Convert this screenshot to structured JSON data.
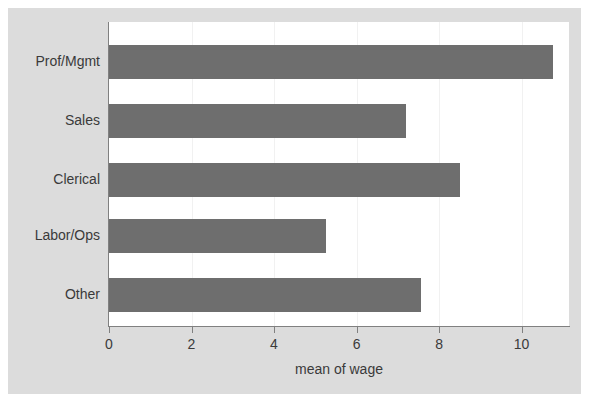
{
  "chart_data": {
    "type": "bar",
    "orientation": "horizontal",
    "title": "",
    "xlabel": "mean of wage",
    "ylabel": "",
    "categories": [
      "Prof/Mgmt",
      "Sales",
      "Clerical",
      "Labor/Ops",
      "Other"
    ],
    "values": [
      10.76,
      7.21,
      8.51,
      5.25,
      7.57
    ],
    "xlim": [
      0,
      11.15
    ],
    "xticks": [
      0,
      2,
      4,
      6,
      8,
      10
    ],
    "xtick_labels": [
      "0",
      "2",
      "4",
      "6",
      "8",
      "10"
    ],
    "grid": "faint vertical gridlines at x ticks",
    "legend": "none",
    "bar_color": "#6e6e6e",
    "panel_color": "#ffffff",
    "figure_color": "#dcdcdc",
    "axis_color": "#808080",
    "text_color": "#3a3a3a"
  }
}
